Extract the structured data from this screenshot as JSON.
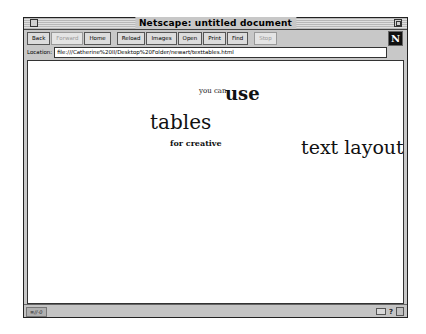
{
  "window": {
    "title": "Netscape: untitled document"
  },
  "toolbar": {
    "group1": [
      {
        "label": "Back",
        "enabled": true
      },
      {
        "label": "Forward",
        "enabled": false
      },
      {
        "label": "Home",
        "enabled": true
      }
    ],
    "group2": [
      {
        "label": "Reload",
        "enabled": true
      },
      {
        "label": "Images",
        "enabled": true
      },
      {
        "label": "Open",
        "enabled": true
      },
      {
        "label": "Print",
        "enabled": true
      },
      {
        "label": "Find",
        "enabled": true
      }
    ],
    "group3": [
      {
        "label": "Stop",
        "enabled": false
      }
    ],
    "logo": "N"
  },
  "location": {
    "label": "Location:",
    "value": "file:///Catherine%20II/Desktop%20Folder/newart/texttables.html"
  },
  "page": {
    "words": {
      "you_can": "you can",
      "use": "use",
      "tables": "tables",
      "for_creative": "for creative",
      "text_layout": "text layout"
    }
  },
  "statusbar": {
    "indicator": "≡//-0",
    "icons": [
      "mail-icon",
      "help-icon",
      "security-icon"
    ]
  },
  "colors": {
    "chrome": "#c8c8c8",
    "content_bg": "#ffffff",
    "logo_bg": "#111111"
  }
}
